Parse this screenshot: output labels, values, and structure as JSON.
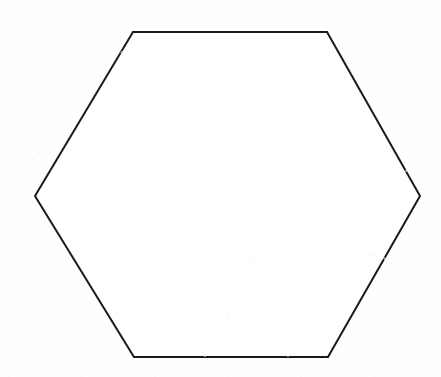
{
  "figure": {
    "shape_name": "hexagon",
    "sides": 6,
    "fill_color": "#ffffff",
    "stroke_color": "#1a1a1a",
    "stroke_width": 2,
    "background_color": "#fefefe",
    "canvas": {
      "width": 441,
      "height": 377
    },
    "vertices": [
      {
        "label": "left",
        "x": 35,
        "y": 196
      },
      {
        "label": "top-left",
        "x": 133,
        "y": 32
      },
      {
        "label": "top-right",
        "x": 327,
        "y": 32
      },
      {
        "label": "right",
        "x": 420,
        "y": 196
      },
      {
        "label": "bottom-right",
        "x": 328,
        "y": 357
      },
      {
        "label": "bottom-left",
        "x": 134,
        "y": 357
      }
    ],
    "points_attr": "35,196 133,32 327,32 420,196 328,357 134,357"
  }
}
